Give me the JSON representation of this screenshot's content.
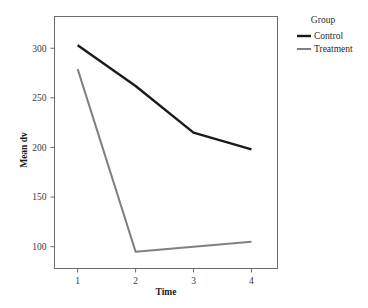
{
  "chart_data": {
    "type": "line",
    "title": "",
    "subtitle": "",
    "xlabel": "Time",
    "ylabel": "Mean dv",
    "x": [
      1,
      2,
      3,
      4
    ],
    "xticklabels": [
      "1",
      "2",
      "3",
      "4"
    ],
    "yticks": [
      100,
      150,
      200,
      250,
      300
    ],
    "yticklabels": [
      "100",
      "150",
      "200",
      "250",
      "300"
    ],
    "xlim": [
      0.6,
      4.45
    ],
    "ylim": [
      78,
      332
    ],
    "grid": false,
    "legend_position": "right",
    "legend_title": "Group",
    "series": [
      {
        "name": "Control",
        "values": [
          303,
          262,
          215,
          198
        ],
        "color": "#1a1a1a",
        "width": 2.4
      },
      {
        "name": "Treatment",
        "values": [
          279,
          95,
          100,
          105
        ],
        "color": "#808080",
        "width": 2.0
      }
    ]
  },
  "figure": {
    "background_color": "#ffffff",
    "panel_border_color": "#6b6b6b",
    "tick_color": "#6b6b6b"
  }
}
